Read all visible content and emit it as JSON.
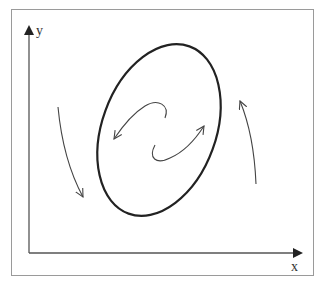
{
  "diagram": {
    "type": "phase-portrait",
    "axes": {
      "x_label": "x",
      "y_label": "y"
    },
    "elements": [
      {
        "name": "limit-cycle",
        "shape": "tilted-ellipse"
      },
      {
        "name": "outer-trajectory-left",
        "direction": "downward"
      },
      {
        "name": "outer-trajectory-right",
        "direction": "upward"
      },
      {
        "name": "inner-spiral-upper",
        "direction": "outward-left"
      },
      {
        "name": "inner-spiral-lower",
        "direction": "outward-right"
      }
    ],
    "colors": {
      "stroke": "#222222",
      "thin_stroke": "#444444",
      "frame": "#9a9a9a",
      "background": "#ffffff"
    }
  }
}
